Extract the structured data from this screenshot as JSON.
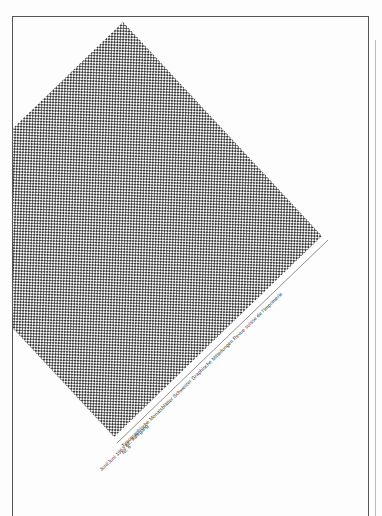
{
  "document": {
    "type": "magazine-cover",
    "pattern": {
      "description": "rotated square filled with fine checker/grid pattern",
      "color": "#3a3a3a",
      "vertices": {
        "top": [
          123,
          22
        ],
        "right": [
          322,
          236
        ],
        "bottom": [
          114,
          437
        ]
      }
    },
    "captions": {
      "line1": "Typographische Monatsblätter   Schweizer Graphische Mitteilungen   Revue suisse de l'Imprimerie",
      "line2": "Nr. 6",
      "line3": "Juni/Juni 1963  82. Jahrgang"
    }
  }
}
